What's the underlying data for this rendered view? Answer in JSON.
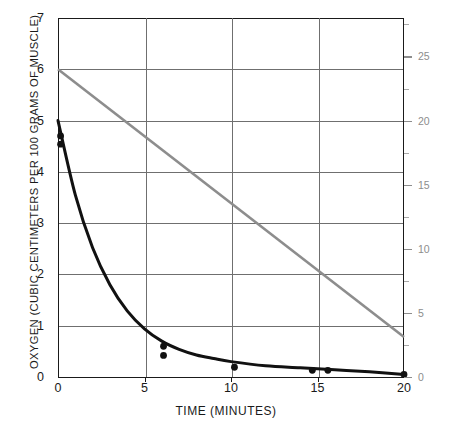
{
  "chart_data": {
    "type": "line",
    "title": "",
    "xlabel": "TIME (MINUTES)",
    "ylabel": "OXYGEN (CUBIC CENTIMETERS PER 100 GRAMS OF MUSCLE)",
    "ylabel_right": "OXYGEN (CUBIC CENTIMETERS PER 100 CUBIC CENTIMETERS OF BLOOD)",
    "xlim": [
      0,
      20
    ],
    "ylim": [
      0,
      7
    ],
    "ylim_right": [
      0,
      28
    ],
    "xticks": [
      "0",
      "5",
      "10",
      "15",
      "20"
    ],
    "xtick_values": [
      0,
      5,
      10,
      15,
      20
    ],
    "yticks": [
      "0",
      "1",
      "2",
      "3",
      "4",
      "5",
      "6",
      "7"
    ],
    "ytick_values": [
      0,
      1,
      2,
      3,
      4,
      5,
      6,
      7
    ],
    "yticks_right": [
      "0",
      "5",
      "10",
      "15",
      "20",
      "25"
    ],
    "ytick_values_right": [
      0,
      5,
      10,
      15,
      20,
      25
    ],
    "ytick_minor_right": [
      2.5,
      7.5,
      12.5,
      17.5,
      22.5,
      27.5
    ],
    "grid": true,
    "grid_x_values": [
      5,
      10,
      15
    ],
    "legend": "none",
    "series": [
      {
        "name": "muscle-oxygen-curve",
        "axis": "left",
        "color": "#111111",
        "style": "exponential-decay-curve",
        "x": [
          0,
          1,
          2,
          3,
          4,
          5,
          6,
          7,
          8,
          9,
          10,
          12,
          14,
          16,
          18,
          20
        ],
        "values": [
          5.0,
          3.55,
          2.52,
          1.8,
          1.29,
          0.94,
          0.7,
          0.54,
          0.43,
          0.36,
          0.3,
          0.22,
          0.18,
          0.14,
          0.1,
          0.05
        ]
      },
      {
        "name": "blood-oxygen-line",
        "axis": "right",
        "color": "#8d8d8d",
        "style": "straight-line",
        "x": [
          0,
          20
        ],
        "values": [
          24.0,
          3.1
        ],
        "values_left_scale": [
          6.0,
          0.78
        ]
      }
    ],
    "points": [
      {
        "series": "muscle-oxygen-curve",
        "x": 0.15,
        "y": 4.7
      },
      {
        "series": "muscle-oxygen-curve",
        "x": 0.15,
        "y": 4.54
      },
      {
        "series": "muscle-oxygen-curve",
        "x": 6.1,
        "y": 0.6
      },
      {
        "series": "muscle-oxygen-curve",
        "x": 6.1,
        "y": 0.42
      },
      {
        "series": "muscle-oxygen-curve",
        "x": 10.2,
        "y": 0.19
      },
      {
        "series": "muscle-oxygen-curve",
        "x": 14.7,
        "y": 0.13
      },
      {
        "series": "muscle-oxygen-curve",
        "x": 15.6,
        "y": 0.13
      },
      {
        "series": "muscle-oxygen-curve",
        "x": 20.0,
        "y": 0.05
      }
    ]
  },
  "colors": {
    "axis": "#1a1a1a",
    "grid": "#6f6f6f",
    "muscle_series": "#111111",
    "blood_series": "#8d8d8d",
    "background": "#ffffff"
  }
}
